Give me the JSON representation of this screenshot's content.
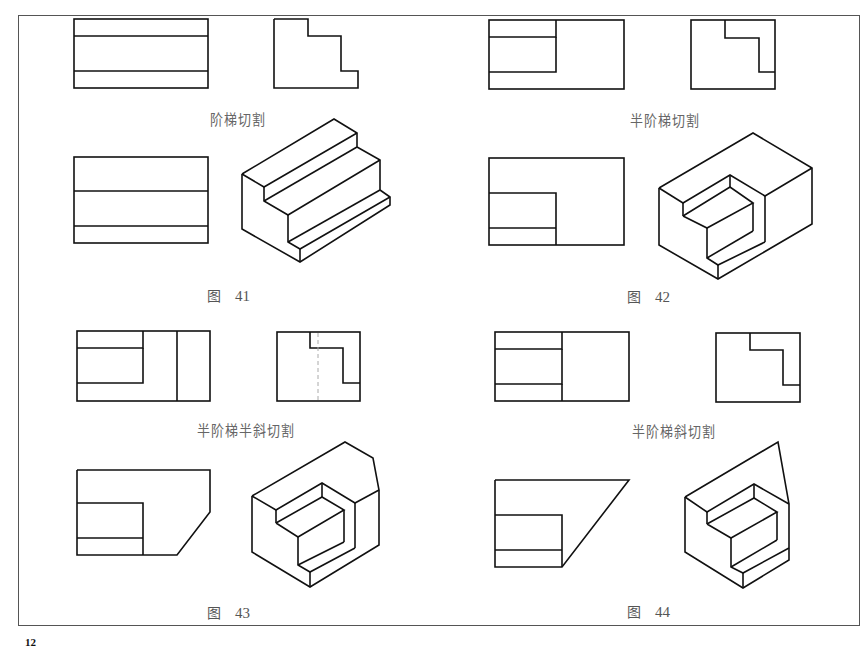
{
  "page": {
    "page_number": "12",
    "figures": [
      {
        "id": "fig41",
        "caption_prefix": "图",
        "number": "41",
        "cut_label": "阶梯切割"
      },
      {
        "id": "fig42",
        "caption_prefix": "图",
        "number": "42",
        "cut_label": "半阶梯切割"
      },
      {
        "id": "fig43",
        "caption_prefix": "图",
        "number": "43",
        "cut_label": "半阶梯半斜切割"
      },
      {
        "id": "fig44",
        "caption_prefix": "图",
        "number": "44",
        "cut_label": "半阶梯斜切割"
      }
    ]
  },
  "style": {
    "line_color": "#111111",
    "border_color": "#555555",
    "hidden_line_color": "#aaaaaa"
  }
}
